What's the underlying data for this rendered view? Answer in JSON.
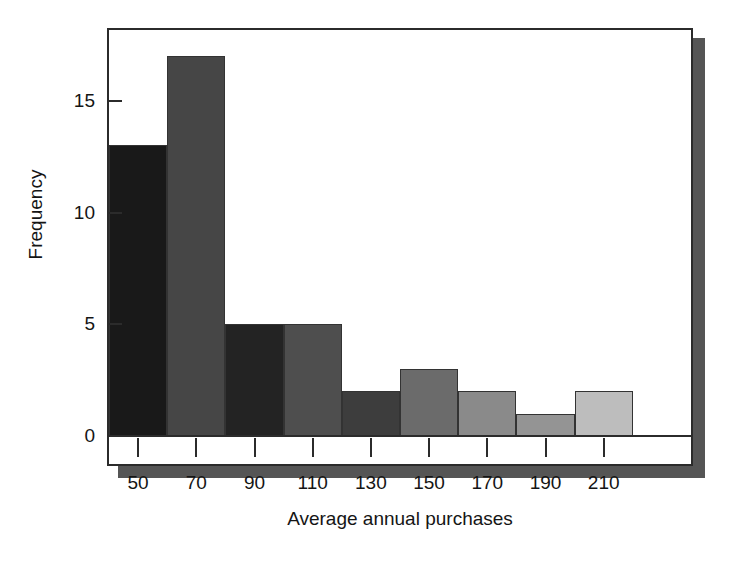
{
  "chart_data": {
    "type": "bar",
    "title": "",
    "subtitle": "",
    "xlabel": "Average annual purchases",
    "ylabel": "Frequency",
    "categories": [
      "50",
      "70",
      "90",
      "110",
      "130",
      "150",
      "170",
      "190",
      "210"
    ],
    "values": [
      13,
      17,
      5,
      5,
      2,
      3,
      2,
      1,
      2
    ],
    "bin_width": 20,
    "bin_edges": [
      40,
      60,
      80,
      100,
      120,
      140,
      160,
      180,
      200,
      220
    ],
    "xlim": [
      40,
      240
    ],
    "ylim": [
      0,
      18.4
    ],
    "ytick_values": [
      0,
      5,
      10,
      15
    ],
    "ytick_labels": [
      "0",
      "5",
      "10",
      "15"
    ],
    "xtick_labels": [
      "50",
      "70",
      "90",
      "110",
      "130",
      "150",
      "170",
      "190",
      "210"
    ],
    "grid": false,
    "legend": false,
    "legend_position": "none",
    "bar_colors": [
      "#191919",
      "#464646",
      "#232323",
      "#4e4e4e",
      "#3d3d3d",
      "#6b6b6b",
      "#8a8a8a",
      "#949494",
      "#bdbdbd"
    ],
    "bar_edge_color": "#333333",
    "axis_color": "#2b2b2b",
    "shadow_color": "#555555",
    "background_color": "#ffffff"
  },
  "figure": {
    "y_axis_title": "Frequency",
    "x_axis_title": "Average annual purchases"
  }
}
